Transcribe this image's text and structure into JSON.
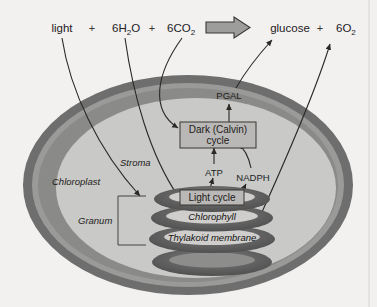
{
  "figure": {
    "title_equation": {
      "reactants": [
        {
          "name": "light",
          "text": "light"
        },
        {
          "name": "water",
          "text": "6H",
          "sub": "2",
          "after": "O"
        },
        {
          "name": "carbon-dioxide",
          "text": "6CO",
          "sub": "2",
          "after": ""
        }
      ],
      "plus_sign": "+",
      "arrow": "reaction-arrow",
      "products": [
        {
          "name": "glucose",
          "text": "glucose"
        },
        {
          "name": "oxygen",
          "text": "6O",
          "sub": "2",
          "after": ""
        }
      ],
      "light_label": "light",
      "water_label": "6H",
      "water_sub": "2",
      "water_tail": "O",
      "co2_label": "6CO",
      "co2_sub": "2",
      "glucose_label": "glucose",
      "o2_label": "6O",
      "o2_sub": "2"
    },
    "structures": {
      "chloroplast_label": "Chloroplast",
      "stroma_label": "Stroma",
      "granum_label": "Granum"
    },
    "process_boxes": {
      "calvin_line1": "Dark (Calvin)",
      "calvin_line2": "cycle",
      "light_cycle": "Light cycle"
    },
    "molecules": {
      "pgal": "PGAL",
      "atp": "ATP",
      "nadph": "NADPH"
    },
    "thylakoid_stack": [
      {
        "name": "disc-light-cycle",
        "label": "Light cycle",
        "boxed": true
      },
      {
        "name": "disc-chlorophyll",
        "label": "Chlorophyll",
        "boxed": false
      },
      {
        "name": "disc-thylakoid-membrane",
        "label": "Thylakoid membrane",
        "boxed": false
      },
      {
        "name": "disc-unlabeled",
        "label": "",
        "boxed": false
      }
    ],
    "colors": {
      "background": "#f2f1ef",
      "outer_membrane": "#6e6e6e",
      "inner_membrane": "#8e8e8e",
      "stroma_fill": "#c9c9c7",
      "disc_dark": "#5f5f5f",
      "disc_light": "#d6d5d3",
      "box_fill": "#b9b8b6",
      "line": "#2b2826"
    }
  }
}
